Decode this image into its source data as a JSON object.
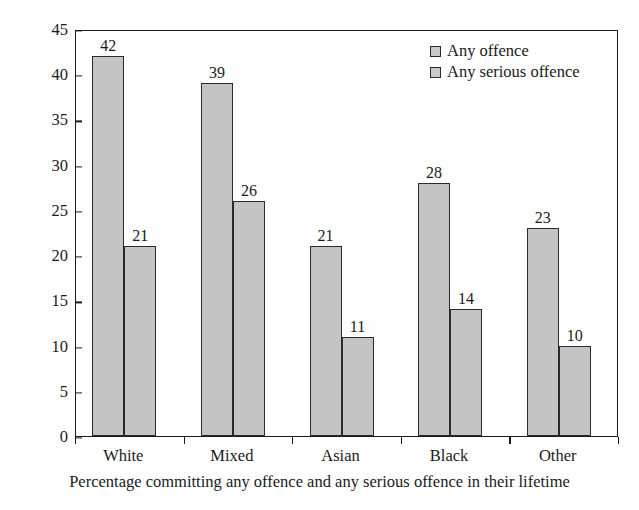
{
  "chart_data": {
    "type": "bar",
    "title": "",
    "xlabel": "Percentage committing any offence and any serious offence in their lifetime",
    "ylabel": "Percentage",
    "categories": [
      "White",
      "Mixed",
      "Asian",
      "Black",
      "Other"
    ],
    "series": [
      {
        "name": "Any offence",
        "values": [
          42,
          39,
          21,
          28,
          23
        ]
      },
      {
        "name": "Any serious offence",
        "values": [
          21,
          26,
          11,
          14,
          10
        ]
      }
    ],
    "ylim": [
      0,
      45
    ],
    "yticks": [
      0,
      5,
      10,
      15,
      20,
      25,
      30,
      35,
      40,
      45
    ],
    "grid": false,
    "legend_position": "top-right",
    "colors": {
      "bar_fill": "#c4c4c4",
      "bar_outline": "#2b2b2b",
      "axis": "#1a1a1a",
      "background": "#ffffff"
    }
  }
}
